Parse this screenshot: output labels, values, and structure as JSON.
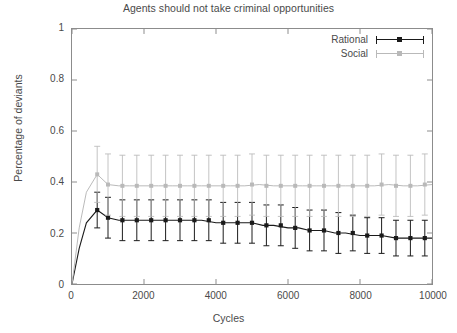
{
  "chart_data": {
    "type": "line",
    "title": "Agents should not take criminal opportunities",
    "xlabel": "Cycles",
    "ylabel": "Percentage of deviants",
    "xlim": [
      0,
      10000
    ],
    "ylim": [
      0,
      1
    ],
    "xticks": [
      0,
      2000,
      4000,
      6000,
      8000,
      10000
    ],
    "xtick_labels": [
      "0",
      "2000",
      "4000",
      "6000",
      "8000",
      "10000"
    ],
    "yticks": [
      0,
      0.2,
      0.4,
      0.6,
      0.8,
      1
    ],
    "ytick_labels": [
      "0",
      "0.2",
      "0.4",
      "0.6",
      "0.8",
      "1"
    ],
    "grid": false,
    "legend_position": "top-right-inside",
    "errorbars": true,
    "marker": "filled-square",
    "series": [
      {
        "name": "Rational",
        "color": "#1a1a1a",
        "x": [
          0,
          200,
          400,
          700,
          1000,
          1300,
          1600,
          2000,
          2300,
          2600,
          3000,
          3300,
          3600,
          4000,
          4300,
          4600,
          5000,
          5300,
          5600,
          6000,
          6300,
          6600,
          7000,
          7300,
          7600,
          8000,
          8300,
          8600,
          9000,
          9300,
          9600,
          10000
        ],
        "values": [
          0.0,
          0.14,
          0.24,
          0.29,
          0.26,
          0.25,
          0.25,
          0.25,
          0.25,
          0.25,
          0.25,
          0.25,
          0.25,
          0.24,
          0.24,
          0.24,
          0.24,
          0.23,
          0.23,
          0.22,
          0.22,
          0.21,
          0.21,
          0.2,
          0.2,
          0.19,
          0.19,
          0.19,
          0.18,
          0.18,
          0.18,
          0.18
        ],
        "yerr": [
          0.0,
          0.05,
          0.07,
          0.07,
          0.08,
          0.08,
          0.08,
          0.08,
          0.08,
          0.08,
          0.08,
          0.08,
          0.08,
          0.08,
          0.08,
          0.08,
          0.08,
          0.08,
          0.08,
          0.08,
          0.08,
          0.08,
          0.08,
          0.08,
          0.08,
          0.07,
          0.07,
          0.07,
          0.07,
          0.07,
          0.07,
          0.07
        ],
        "marker_x": [
          700,
          1000,
          1400,
          1800,
          2200,
          2600,
          3000,
          3400,
          3800,
          4200,
          4600,
          5000,
          5400,
          5800,
          6200,
          6600,
          7000,
          7400,
          7800,
          8200,
          8600,
          9000,
          9400,
          9800
        ],
        "marker_values": [
          0.29,
          0.26,
          0.25,
          0.25,
          0.25,
          0.25,
          0.25,
          0.25,
          0.25,
          0.24,
          0.24,
          0.24,
          0.23,
          0.23,
          0.22,
          0.21,
          0.21,
          0.2,
          0.2,
          0.19,
          0.19,
          0.18,
          0.18,
          0.18
        ],
        "marker_yerr": [
          0.07,
          0.08,
          0.08,
          0.08,
          0.08,
          0.08,
          0.08,
          0.08,
          0.08,
          0.08,
          0.08,
          0.08,
          0.08,
          0.08,
          0.08,
          0.08,
          0.08,
          0.08,
          0.07,
          0.07,
          0.07,
          0.07,
          0.07,
          0.07
        ]
      },
      {
        "name": "Social",
        "color": "#b9b9b9",
        "x": [
          0,
          200,
          400,
          700,
          1000,
          1300,
          1600,
          2000,
          2400,
          2800,
          3200,
          3600,
          4000,
          4400,
          4800,
          5200,
          5600,
          6000,
          6400,
          6800,
          7200,
          7600,
          8000,
          8400,
          8800,
          9200,
          9600,
          10000
        ],
        "values": [
          0.0,
          0.22,
          0.36,
          0.43,
          0.39,
          0.385,
          0.385,
          0.385,
          0.385,
          0.385,
          0.385,
          0.385,
          0.385,
          0.385,
          0.385,
          0.39,
          0.385,
          0.385,
          0.385,
          0.385,
          0.385,
          0.385,
          0.385,
          0.385,
          0.39,
          0.385,
          0.385,
          0.39
        ],
        "yerr": [
          0.0,
          0.08,
          0.11,
          0.12,
          0.12,
          0.12,
          0.12,
          0.12,
          0.12,
          0.12,
          0.12,
          0.12,
          0.12,
          0.12,
          0.12,
          0.12,
          0.12,
          0.12,
          0.12,
          0.12,
          0.12,
          0.12,
          0.12,
          0.12,
          0.12,
          0.12,
          0.12,
          0.12
        ],
        "marker_x": [
          700,
          1000,
          1400,
          1800,
          2200,
          2600,
          3000,
          3400,
          3800,
          4200,
          4600,
          5000,
          5400,
          5800,
          6200,
          6600,
          7000,
          7400,
          7800,
          8200,
          8600,
          9000,
          9400,
          9800
        ],
        "marker_values": [
          0.43,
          0.39,
          0.385,
          0.385,
          0.385,
          0.385,
          0.385,
          0.385,
          0.385,
          0.385,
          0.385,
          0.39,
          0.385,
          0.385,
          0.385,
          0.385,
          0.385,
          0.385,
          0.385,
          0.385,
          0.39,
          0.385,
          0.385,
          0.39
        ],
        "marker_yerr": [
          0.11,
          0.12,
          0.12,
          0.12,
          0.12,
          0.12,
          0.12,
          0.12,
          0.12,
          0.12,
          0.12,
          0.12,
          0.12,
          0.12,
          0.12,
          0.12,
          0.12,
          0.12,
          0.12,
          0.12,
          0.12,
          0.12,
          0.12,
          0.12
        ]
      }
    ]
  },
  "legend": {
    "entries": [
      {
        "label": "Rational",
        "color": "#1a1a1a"
      },
      {
        "label": "Social",
        "color": "#b9b9b9"
      }
    ]
  },
  "axis_colors": {
    "frame": "#8c8c8c",
    "tick_text": "#4a4a4a"
  }
}
